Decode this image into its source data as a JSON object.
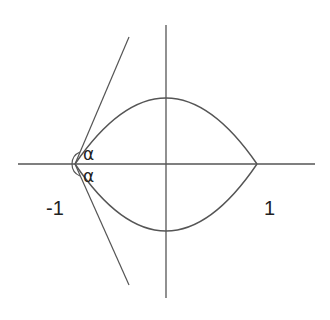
{
  "diagram": {
    "type": "lens-shaped region bounded by two circular arcs with tangent lines at a vertex",
    "colors": {
      "background": "#ffffff",
      "stroke": "#444444",
      "text": "#222222"
    },
    "axes": {
      "horizontal": {
        "x1": 18,
        "y1": 164,
        "x2": 315,
        "y2": 164
      },
      "vertical": {
        "x1": 166,
        "y1": 25,
        "x2": 166,
        "y2": 298
      }
    },
    "vertices": {
      "left": {
        "x": 75,
        "y": 164,
        "value": "-1"
      },
      "right": {
        "x": 257,
        "y": 164,
        "value": "1"
      }
    },
    "arcs": {
      "upper_top": {
        "x": 166,
        "y": 98
      },
      "lower_bottom": {
        "x": 166,
        "y": 231
      }
    },
    "tangents": {
      "upper": {
        "x1": 75,
        "y1": 164,
        "x2": 129,
        "y2": 37
      },
      "lower": {
        "x1": 75,
        "y1": 164,
        "x2": 129,
        "y2": 285
      }
    },
    "angle_marker": {
      "cx": 75,
      "cy": 164,
      "r": 13
    },
    "labels": {
      "minus_one": "-1",
      "one": "1",
      "alpha_upper": "α",
      "alpha_lower": "α"
    }
  }
}
